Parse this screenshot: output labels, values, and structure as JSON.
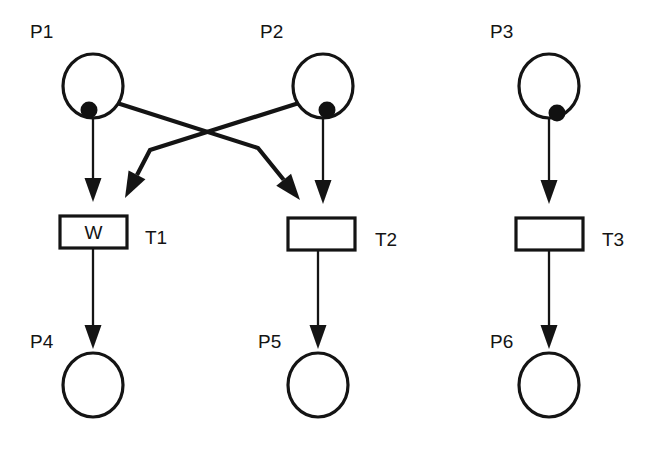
{
  "diagram": {
    "type": "petri-net",
    "colors": {
      "stroke": "#141414",
      "fill": "#ffffff",
      "token": "#111111"
    },
    "places": [
      {
        "id": "P1",
        "label": "P1",
        "cx": 93,
        "cy": 86,
        "rx": 30,
        "ry": 32,
        "tokens": 1,
        "token_dx": -4,
        "token_dy": 24,
        "label_x": 30,
        "label_y": 38
      },
      {
        "id": "P2",
        "label": "P2",
        "cx": 323,
        "cy": 86,
        "rx": 30,
        "ry": 32,
        "tokens": 1,
        "token_dx": 4,
        "token_dy": 24,
        "label_x": 260,
        "label_y": 38
      },
      {
        "id": "P3",
        "label": "P3",
        "cx": 549,
        "cy": 86,
        "rx": 30,
        "ry": 32,
        "tokens": 1,
        "token_dx": 8,
        "token_dy": 27,
        "label_x": 490,
        "label_y": 38
      },
      {
        "id": "P4",
        "label": "P4",
        "cx": 93,
        "cy": 385,
        "rx": 30,
        "ry": 32,
        "tokens": 0,
        "token_dx": 0,
        "token_dy": 0,
        "label_x": 30,
        "label_y": 348
      },
      {
        "id": "P5",
        "label": "P5",
        "cx": 318,
        "cy": 385,
        "rx": 30,
        "ry": 32,
        "tokens": 0,
        "token_dx": 0,
        "token_dy": 0,
        "label_x": 258,
        "label_y": 348
      },
      {
        "id": "P6",
        "label": "P6",
        "cx": 549,
        "cy": 385,
        "rx": 30,
        "ry": 32,
        "tokens": 0,
        "token_dx": 0,
        "token_dy": 0,
        "label_x": 490,
        "label_y": 348
      }
    ],
    "transitions": [
      {
        "id": "T1",
        "label": "T1",
        "inner_text": "W",
        "x": 60,
        "y": 216,
        "width": 67,
        "height": 32,
        "label_x": 145,
        "label_y": 244
      },
      {
        "id": "T2",
        "label": "T2",
        "inner_text": "",
        "x": 288,
        "y": 218,
        "width": 67,
        "height": 32,
        "label_x": 375,
        "label_y": 246
      },
      {
        "id": "T3",
        "label": "T3",
        "inner_text": "",
        "x": 516,
        "y": 218,
        "width": 67,
        "height": 32,
        "label_x": 602,
        "label_y": 246
      }
    ],
    "arcs": [
      {
        "id": "arc-p1-t1",
        "from": "P1",
        "to": "T1",
        "weight": "thin",
        "path": "93,118 93,202"
      },
      {
        "id": "arc-p1-t2",
        "from": "P1",
        "to": "T2",
        "weight": "thick",
        "path": "117,103 258,148 300,200"
      },
      {
        "id": "arc-p2-t1",
        "from": "P2",
        "to": "T1",
        "weight": "thick",
        "path": "299,103 150,150 125,198"
      },
      {
        "id": "arc-p2-t2",
        "from": "P2",
        "to": "T2",
        "weight": "thin",
        "path": "323,118 323,204"
      },
      {
        "id": "arc-p3-t3",
        "from": "P3",
        "to": "T3",
        "weight": "thin",
        "path": "549,118 549,204"
      },
      {
        "id": "arc-t1-p4",
        "from": "T1",
        "to": "P4",
        "weight": "thin",
        "path": "93,248 93,349"
      },
      {
        "id": "arc-t2-p5",
        "from": "T2",
        "to": "P5",
        "weight": "thin",
        "path": "318,250 318,349"
      },
      {
        "id": "arc-t3-p6",
        "from": "T3",
        "to": "P6",
        "weight": "thin",
        "path": "549,250 549,349"
      }
    ]
  }
}
